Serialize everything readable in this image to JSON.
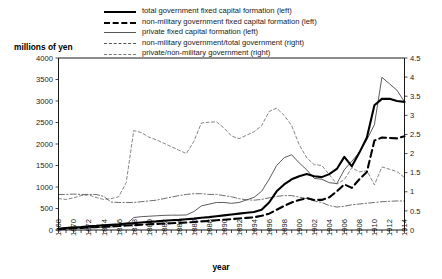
{
  "chart_data": {
    "type": "line",
    "title": "",
    "xlabel": "year",
    "ylabel": "millions of yen",
    "ylabel_right": "",
    "xlim": [
      1868,
      1914
    ],
    "ylim": [
      0,
      4000
    ],
    "ylim_right": [
      0,
      4.5
    ],
    "grid": false,
    "legend_position": "top-center",
    "yticks": [
      "0",
      "500",
      "1000",
      "1500",
      "2000",
      "2500",
      "3000",
      "3500",
      "4000"
    ],
    "yticks_right": [
      "0",
      "0.5",
      "1",
      "1.5",
      "2",
      "2.5",
      "3",
      "3.5",
      "4",
      "4.5"
    ],
    "xticks": [
      "1868",
      "1870",
      "1872",
      "1874",
      "1876",
      "1878",
      "1880",
      "1882",
      "1884",
      "1886",
      "1888",
      "1890",
      "1892",
      "1894",
      "1896",
      "1898",
      "1900",
      "1902",
      "1904",
      "1906",
      "1908",
      "1910",
      "1912",
      "1914"
    ],
    "x": [
      1868,
      1869,
      1870,
      1871,
      1872,
      1873,
      1874,
      1875,
      1876,
      1877,
      1878,
      1879,
      1880,
      1881,
      1882,
      1883,
      1884,
      1885,
      1886,
      1887,
      1888,
      1889,
      1890,
      1891,
      1892,
      1893,
      1894,
      1895,
      1896,
      1897,
      1898,
      1899,
      1900,
      1901,
      1902,
      1903,
      1904,
      1905,
      1906,
      1907,
      1908,
      1909,
      1910,
      1911,
      1912,
      1913,
      1914
    ],
    "series": [
      {
        "name": "total government fixed capital formation (left)",
        "axis": "left",
        "style": "solid-thick",
        "values": [
          30,
          45,
          60,
          70,
          85,
          95,
          110,
          120,
          130,
          150,
          160,
          175,
          190,
          200,
          215,
          225,
          235,
          250,
          265,
          285,
          300,
          320,
          340,
          360,
          380,
          400,
          420,
          470,
          640,
          900,
          1060,
          1180,
          1250,
          1300,
          1250,
          1230,
          1300,
          1420,
          1700,
          1480,
          1800,
          2150,
          2900,
          3050,
          3050,
          3000,
          2980
        ]
      },
      {
        "name": "non-military government fixed capital formation (left)",
        "axis": "left",
        "style": "dash-thick",
        "values": [
          22,
          32,
          42,
          50,
          60,
          68,
          78,
          85,
          92,
          105,
          112,
          122,
          132,
          140,
          150,
          158,
          165,
          175,
          185,
          200,
          212,
          226,
          240,
          252,
          268,
          282,
          296,
          330,
          380,
          470,
          560,
          640,
          700,
          740,
          700,
          700,
          760,
          900,
          1060,
          980,
          1180,
          1350,
          2080,
          2150,
          2140,
          2130,
          2180
        ]
      },
      {
        "name": "private fixed capital formation (left)",
        "axis": "left",
        "style": "solid-thin",
        "values": [
          18,
          25,
          35,
          45,
          55,
          58,
          62,
          70,
          80,
          130,
          290,
          310,
          320,
          330,
          340,
          345,
          345,
          350,
          430,
          560,
          600,
          640,
          640,
          620,
          640,
          700,
          760,
          900,
          1180,
          1500,
          1680,
          1750,
          1560,
          1400,
          1200,
          1180,
          1100,
          1080,
          1400,
          1600,
          1800,
          2100,
          2450,
          3550,
          3400,
          3250,
          2980
        ]
      },
      {
        "name": "non-military government/total government (right)",
        "axis": "right",
        "style": "dash-dot",
        "values": [
          0.93,
          0.93,
          0.94,
          0.93,
          0.93,
          0.93,
          0.88,
          0.73,
          0.72,
          0.72,
          0.72,
          0.74,
          0.76,
          0.78,
          0.82,
          0.86,
          0.9,
          0.93,
          0.95,
          0.95,
          0.93,
          0.93,
          0.9,
          0.87,
          0.82,
          0.79,
          0.78,
          0.8,
          0.84,
          0.88,
          0.9,
          0.9,
          0.86,
          0.82,
          0.76,
          0.72,
          0.64,
          0.6,
          0.62,
          0.66,
          0.68,
          0.7,
          0.72,
          0.74,
          0.75,
          0.76,
          0.76
        ]
      },
      {
        "name": "private/non-military government (right)",
        "axis": "right",
        "style": "dash-thin",
        "values": [
          0.82,
          0.8,
          0.84,
          0.9,
          0.92,
          0.85,
          0.8,
          0.82,
          0.87,
          1.24,
          2.6,
          2.55,
          2.43,
          2.36,
          2.27,
          2.18,
          2.09,
          2.0,
          2.32,
          2.8,
          2.82,
          2.83,
          2.67,
          2.46,
          2.39,
          2.48,
          2.57,
          2.73,
          3.1,
          3.19,
          3.0,
          2.73,
          2.23,
          1.89,
          1.71,
          1.69,
          1.45,
          1.2,
          1.32,
          1.63,
          1.52,
          1.55,
          1.18,
          1.65,
          1.59,
          1.53,
          1.37
        ]
      }
    ]
  },
  "legend": {
    "items": [
      {
        "label": "total government fixed capital formation (left)",
        "style": "solid-thick"
      },
      {
        "label": "non-military government fixed capital formation (left)",
        "style": "dash-thick"
      },
      {
        "label": "private fixed capital formation (left)",
        "style": "solid-thin"
      },
      {
        "label": "non-military government/total government (right)",
        "style": "dash-dot"
      },
      {
        "label": "private/non-military government (right)",
        "style": "dash-thin"
      }
    ]
  }
}
